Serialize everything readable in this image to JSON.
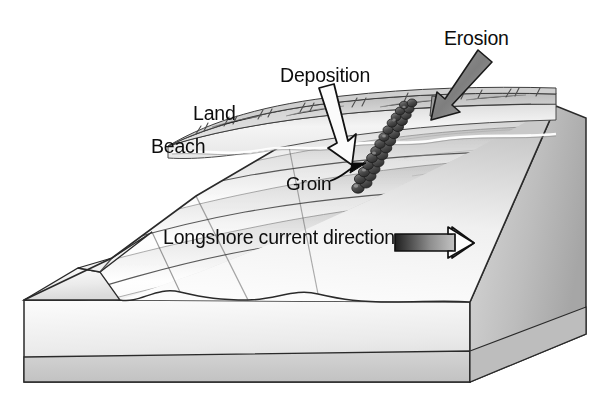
{
  "diagram": {
    "type": "block-diagram",
    "background_color": "#ffffff",
    "text_color": "#0d0d0d"
  },
  "labels": {
    "erosion": "Erosion",
    "deposition": "Deposition",
    "land": "Land",
    "beach": "Beach",
    "groin": "Groin",
    "longshore": "Longshore current direction"
  },
  "arrows": {
    "erosion": {
      "name": "erosion-arrow",
      "style": "gray-filled-outlined",
      "direction": "down-left",
      "fill": "#8a8a8a",
      "stroke": "#1a1a1a"
    },
    "deposition": {
      "name": "deposition-arrow",
      "style": "white-filled-outlined",
      "direction": "down-right",
      "fill": "#fbfbfb",
      "stroke": "#111111"
    },
    "groin_pointer": {
      "name": "groin-pointer-arrow",
      "style": "thin-solid-curved",
      "direction": "up-right",
      "stroke": "#0a0a0a"
    },
    "longshore": {
      "name": "longshore-current-arrow",
      "style": "gradient-shaft-white-head",
      "direction": "right",
      "shaft_dark": "#2b2b2b",
      "shaft_light": "#e8e8e8",
      "head_fill": "#fdfdfd",
      "stroke": "#111111"
    }
  },
  "features": {
    "land": {
      "name": "land-surface",
      "fill_light": "#e4e4e4",
      "fill_dark": "#b9b9b9",
      "texture": "grass-tufts"
    },
    "beach": {
      "name": "beach-strip",
      "fill_light": "#f2f2f2",
      "fill_dark": "#d2d2d2"
    },
    "water": {
      "name": "water-surface",
      "fill_light": "#fdfdfd",
      "fill_dark": "#c8c8c8",
      "wave_count": 8
    },
    "groin": {
      "name": "groin-structure",
      "material": "boulders",
      "fill": "#4a4a4a",
      "boulder_count": 26
    },
    "block_front": {
      "name": "block-front-face",
      "fill_light": "#fafafa",
      "fill_dark": "#d9d9d9"
    },
    "block_side": {
      "name": "block-right-face",
      "fill_light": "#d6d6d6",
      "fill_dark": "#a9a9a9"
    },
    "strata": {
      "name": "basal-strata-band",
      "fill": "#cccccc"
    },
    "outline": {
      "name": "block-outline",
      "stroke": "#2a2a2a"
    }
  }
}
